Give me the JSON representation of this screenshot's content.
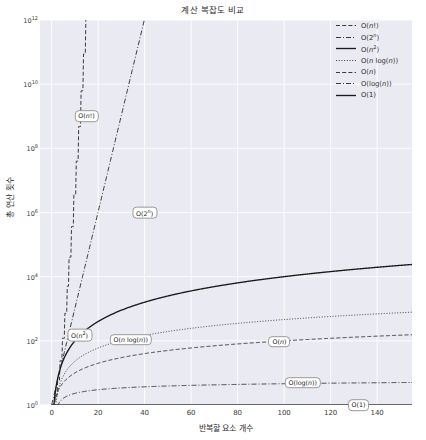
{
  "chart_data": {
    "type": "line",
    "title": "계산 복잡도 비교",
    "xlabel": "반복할 요소 개수",
    "ylabel": "총 연산 횟수",
    "yscale": "log",
    "xlim": [
      -5,
      155
    ],
    "ylim": [
      1,
      1000000000000
    ],
    "grid": true,
    "legend_position": "upper right",
    "x_ticks": [
      "0",
      "20",
      "40",
      "60",
      "80",
      "100",
      "120",
      "140"
    ],
    "x_tick_values": [
      0,
      20,
      40,
      60,
      80,
      100,
      120,
      140
    ],
    "y_ticks": [
      "10^0",
      "10^2",
      "10^4",
      "10^6",
      "10^8",
      "10^10",
      "10^12"
    ],
    "y_tick_values": [
      1,
      100,
      10000,
      1000000,
      100000000,
      10000000000,
      1000000000000
    ],
    "x": [
      1,
      5,
      10,
      15,
      20,
      30,
      40,
      50,
      60,
      70,
      80,
      90,
      100,
      110,
      120,
      130,
      140,
      150
    ],
    "series": [
      {
        "name": "O(n!)",
        "label": "O(n!)",
        "linestyle": "dashed",
        "color": "#3a3a3a",
        "annotation": "O(n!)",
        "annotation_x": 15,
        "annotation_y": 1000000000,
        "values": [
          1,
          120,
          3628800,
          1307674368000,
          2.4e+18,
          2.65e+32,
          8.16e+47,
          3.04e+64,
          8.32e+81,
          1.2e+100,
          7.16e+118,
          1.49e+138,
          9.33e+157,
          1.59e+178,
          6.69e+198,
          6.47e+219,
          1.35e+241,
          5.71e+262
        ]
      },
      {
        "name": "O(2^n)",
        "label": "O(2ⁿ)",
        "linestyle": "dashdot",
        "color": "#3a3a3a",
        "annotation": "O(2ⁿ)",
        "annotation_x": 40,
        "annotation_y": 1000000,
        "values": [
          2,
          32,
          1024,
          32768,
          1048576,
          1073741824,
          1100000000000.0,
          1130000000000000.0,
          1.15e+18,
          1.18e+21,
          1.21e+24,
          1.24e+27,
          1.27e+30,
          1.3e+33,
          1.33e+36,
          1.36e+39,
          1.39e+42,
          1.43e+45
        ]
      },
      {
        "name": "O(n^2)",
        "label": "O(n²)",
        "linestyle": "solid",
        "color": "#1a1a1a",
        "annotation": "O(n²)",
        "annotation_x": 12,
        "annotation_y": 150,
        "values": [
          1,
          25,
          100,
          225,
          400,
          900,
          1600,
          2500,
          3600,
          4900,
          6400,
          8100,
          10000,
          12100,
          14400,
          16900,
          19600,
          22500
        ]
      },
      {
        "name": "O(n log(n))",
        "label": "O(n log(n))",
        "linestyle": "dotted",
        "color": "#3a3a3a",
        "annotation": "O(n log(n))",
        "annotation_x": 34,
        "annotation_y": 110,
        "values": [
          0,
          8,
          23,
          41,
          60,
          102,
          148,
          196,
          246,
          297,
          350,
          405,
          460,
          517,
          574,
          633,
          692,
          752
        ]
      },
      {
        "name": "O(n)",
        "label": "O(n)",
        "linestyle": "dashed",
        "color": "#3a3a3a",
        "annotation": "O(n)",
        "annotation_x": 98,
        "annotation_y": 95,
        "values": [
          1,
          5,
          10,
          15,
          20,
          30,
          40,
          50,
          60,
          70,
          80,
          90,
          100,
          110,
          120,
          130,
          140,
          150
        ]
      },
      {
        "name": "O(log(n))",
        "label": "O(log(n))",
        "linestyle": "dashdot",
        "color": "#3a3a3a",
        "annotation": "O(log(n))",
        "annotation_x": 108,
        "annotation_y": 5.0,
        "values": [
          0,
          1.61,
          2.3,
          2.71,
          3.0,
          3.4,
          3.69,
          3.91,
          4.09,
          4.25,
          4.38,
          4.5,
          4.61,
          4.7,
          4.79,
          4.87,
          4.94,
          5.01
        ]
      },
      {
        "name": "O(1)",
        "label": "O(1)",
        "linestyle": "solid",
        "color": "#3a3a3a",
        "annotation": "O(1)",
        "annotation_x": 132,
        "annotation_y": 1,
        "values": [
          1,
          1,
          1,
          1,
          1,
          1,
          1,
          1,
          1,
          1,
          1,
          1,
          1,
          1,
          1,
          1,
          1,
          1
        ]
      }
    ]
  },
  "legend": {
    "items": [
      {
        "label": "O(n!)",
        "style": "dashed"
      },
      {
        "label": "O(2ⁿ)",
        "style": "dashdot"
      },
      {
        "label": "O(n²)",
        "style": "solid"
      },
      {
        "label": "O(n log(n))",
        "style": "dotted"
      },
      {
        "label": "O(n)",
        "style": "dashed"
      },
      {
        "label": "O(log(n))",
        "style": "dashdot"
      },
      {
        "label": "O(1)",
        "style": "solid"
      }
    ]
  },
  "style": {
    "plot_background": "#eaeaf2",
    "grid_color": "#ffffff",
    "figure_background": "#ffffff",
    "text_color": "#2b2b2b",
    "line_color": "#3a3a3a"
  }
}
